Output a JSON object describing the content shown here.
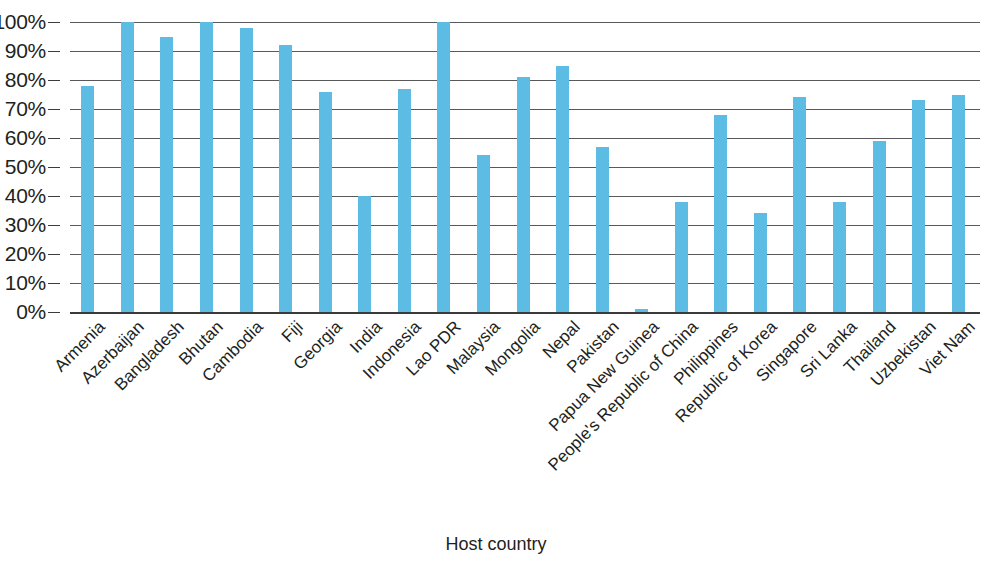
{
  "chart_data": {
    "type": "bar",
    "title": "",
    "subtitle": "",
    "xlabel": "Host country",
    "ylabel": "",
    "ylim": [
      0,
      100
    ],
    "ytick_labels": [
      "0%",
      "10%",
      "20%",
      "30%",
      "40%",
      "50%",
      "60%",
      "70%",
      "80%",
      "90%",
      "100%"
    ],
    "ytick_values": [
      0,
      10,
      20,
      30,
      40,
      50,
      60,
      70,
      80,
      90,
      100
    ],
    "grid": true,
    "legend": null,
    "legend_position": "none",
    "bar_color": "#5dbce3",
    "axis_color": "#3a3a3a",
    "gridline_color": "#58595b",
    "categories": [
      "Armenia",
      "Azerbaijan",
      "Bangladesh",
      "Bhutan",
      "Cambodia",
      "Fiji",
      "Georgia",
      "India",
      "Indonesia",
      "Lao PDR",
      "Malaysia",
      "Mongolia",
      "Nepal",
      "Pakistan",
      "Papua New Guinea",
      "People's Republic of China",
      "Philippines",
      "Republic of Korea",
      "Singapore",
      "Sri Lanka",
      "Thailand",
      "Uzbekistan",
      "Viet Nam"
    ],
    "values": [
      78,
      100,
      95,
      100,
      98,
      92,
      76,
      40,
      77,
      100,
      54,
      81,
      85,
      57,
      1,
      38,
      68,
      34,
      74,
      38,
      59,
      73,
      75
    ]
  }
}
